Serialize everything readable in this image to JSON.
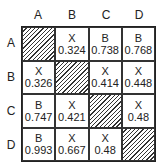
{
  "columns": [
    "A",
    "B",
    "C",
    "D"
  ],
  "rows": [
    "A",
    "B",
    "C",
    "D"
  ],
  "cells": [
    [
      {
        "top": "",
        "bottom": "",
        "diagonal": true
      },
      {
        "top": "X",
        "bottom": "0.324"
      },
      {
        "top": "B",
        "bottom": "0.738"
      },
      {
        "top": "B",
        "bottom": "0.768"
      }
    ],
    [
      {
        "top": "X",
        "bottom": "0.326"
      },
      {
        "top": "",
        "bottom": "",
        "diagonal": true
      },
      {
        "top": "X",
        "bottom": "0.414"
      },
      {
        "top": "X",
        "bottom": "0.448"
      }
    ],
    [
      {
        "top": "B",
        "bottom": "0.747"
      },
      {
        "top": "X",
        "bottom": "0.421"
      },
      {
        "top": "",
        "bottom": "",
        "diagonal": true
      },
      {
        "top": "X",
        "bottom": "0.48"
      }
    ],
    [
      {
        "top": "B",
        "bottom": "0.993"
      },
      {
        "top": "X",
        "bottom": "0.667"
      },
      {
        "top": "X",
        "bottom": "0.48"
      },
      {
        "top": "",
        "bottom": "",
        "diagonal": true
      }
    ]
  ]
}
